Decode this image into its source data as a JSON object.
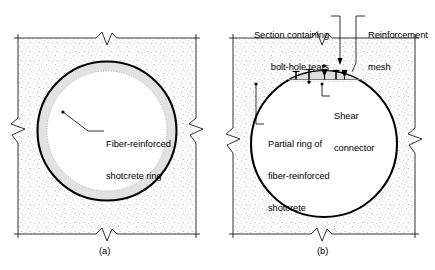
{
  "figure": {
    "title": "",
    "background_color": "#ffffff",
    "ink_color": "#000000",
    "ground_fill_color": "#fdfdfd",
    "stipple_color": "#9aa0a6",
    "ring_fill_color": "#e2e2e2",
    "panels": [
      {
        "id": "a",
        "caption": "(a)",
        "description": "Tunnel cross-section with full fiber-reinforced shotcrete ring",
        "labels": [
          {
            "name": "fiber-reinforced-shotcrete-ring",
            "lines": [
              "Fiber-reinforced",
              "shotcrete ring"
            ],
            "align": "left"
          }
        ]
      },
      {
        "id": "b",
        "caption": "(b)",
        "description": "Tunnel cross-section with partial crown ring, shear connectors and reinforcement mesh",
        "labels": [
          {
            "name": "section-containing-bolt-hole-tears",
            "lines": [
              "Section containing",
              "bolt-hole tears"
            ],
            "align": "right"
          },
          {
            "name": "reinforcement-mesh",
            "lines": [
              "Reinforcement",
              "mesh"
            ],
            "align": "left"
          },
          {
            "name": "shear-connector",
            "lines": [
              "Shear",
              "connector"
            ],
            "align": "left"
          },
          {
            "name": "partial-ring-of-fiber-reinforced-shotcrete",
            "lines": [
              "Partial ring of",
              "fiber-reinforced",
              "shotcrete"
            ],
            "align": "left"
          }
        ]
      }
    ]
  }
}
